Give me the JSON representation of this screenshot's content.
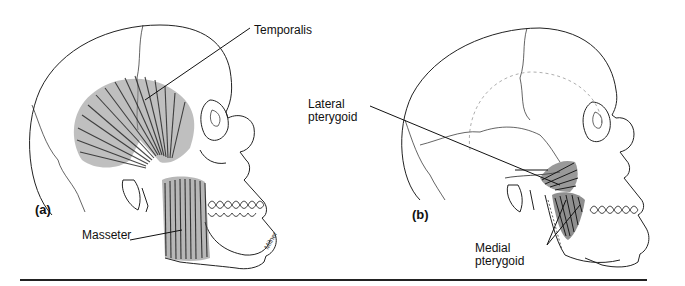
{
  "figure": {
    "panels": [
      {
        "id": "a",
        "panel_label": "(a)",
        "labels": [
          {
            "text": "Temporalis"
          },
          {
            "text": "Masseter"
          }
        ]
      },
      {
        "id": "b",
        "panel_label": "(b)",
        "labels": [
          {
            "text_line1": "Lateral",
            "text_line2": "pterygoid"
          },
          {
            "text_line1": "Medial",
            "text_line2": "pterygoid"
          }
        ]
      }
    ],
    "signature": "Milner",
    "colors": {
      "line": "#222222",
      "muscle": "#333333",
      "background": "#ffffff"
    }
  }
}
